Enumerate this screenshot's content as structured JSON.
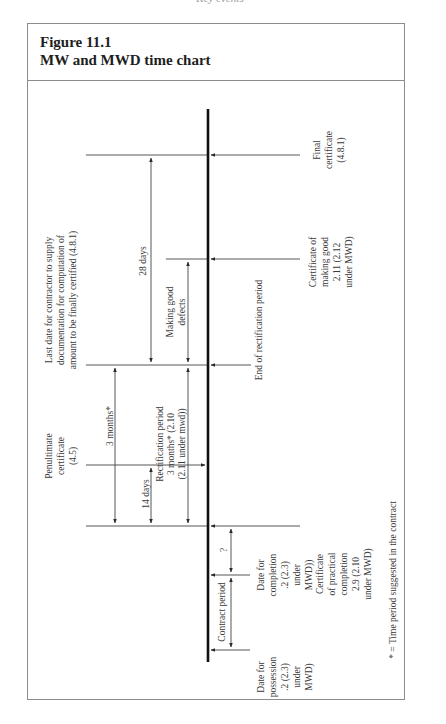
{
  "running_head": "Key events",
  "figure": {
    "number": "Figure 11.1",
    "title": "MW and MWD time chart"
  },
  "diagram": {
    "orientation": "rotated 90° (read with page turned clockwise)",
    "events": {
      "final_certificate": [
        "Final",
        "certificate",
        "(4.8.1)"
      ],
      "certificate_making_good": [
        "Certificate of",
        "making good",
        "2.11 (2.12",
        "under MWD)"
      ],
      "end_rectification": [
        "End of rectification period"
      ],
      "last_date_contractor": [
        "Last date for contractor to supply",
        "documentation for computation of",
        "amount to be finally certified (4.8.1)"
      ],
      "penultimate_certificate": [
        "Penultimate",
        "certificate",
        "(4.5)"
      ],
      "certificate_practical_completion": [
        "Certificate",
        "of practical",
        "completion",
        "2.9 (2.10",
        "under MWD)"
      ],
      "date_for_completion": [
        "Date for",
        "completion",
        ".2 (2.3)",
        "under",
        "MWD))"
      ],
      "date_for_possession": [
        "Date for",
        "possession",
        ".2 (2.3)",
        "under",
        "MWD)"
      ]
    },
    "periods": {
      "twenty_eight_days": "28 days",
      "making_good_defects": [
        "Making good",
        "defects"
      ],
      "three_months": "3 months*",
      "rectification_period": [
        "Rectification period",
        "3 months* (2.10",
        "(2.11 under mwd))"
      ],
      "fourteen_days": "14 days",
      "unknown_period": "?",
      "contract_period": "Contract period"
    },
    "footnote": "* = Time period suggested in the contract"
  }
}
